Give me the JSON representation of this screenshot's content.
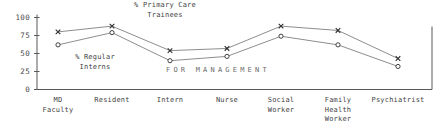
{
  "chart_data": {
    "type": "line",
    "title": "",
    "xlabel": "",
    "ylabel": "",
    "ylim": [
      0,
      100
    ],
    "yticks": [
      0,
      25,
      50,
      75,
      100
    ],
    "grid": false,
    "legend_position": "inline-annotations",
    "categories": [
      "MD\nFaculty",
      "Resident",
      "Intern",
      "Nurse",
      "Social\nWorker",
      "Family\nHealth\nWorker",
      "Psychiatrist"
    ],
    "series": [
      {
        "name": "% Primary Care Trainees",
        "marker": "x",
        "values": [
          80,
          88,
          54,
          57,
          88,
          82,
          43
        ]
      },
      {
        "name": "% Regular Interns",
        "marker": "o",
        "values": [
          62,
          79,
          40,
          46,
          74,
          62,
          32
        ]
      }
    ],
    "annotations": [
      {
        "name": "primary-care-trainees-label",
        "text": "% Primary Care\nTrainees"
      },
      {
        "name": "regular-interns-label",
        "text": "% Regular\nInterns"
      },
      {
        "name": "for-management-watermark",
        "text": "FOR MANAGEMENT"
      }
    ]
  },
  "axis": {
    "y_tick_labels": [
      "100",
      "75",
      "50",
      "25",
      "0"
    ]
  }
}
